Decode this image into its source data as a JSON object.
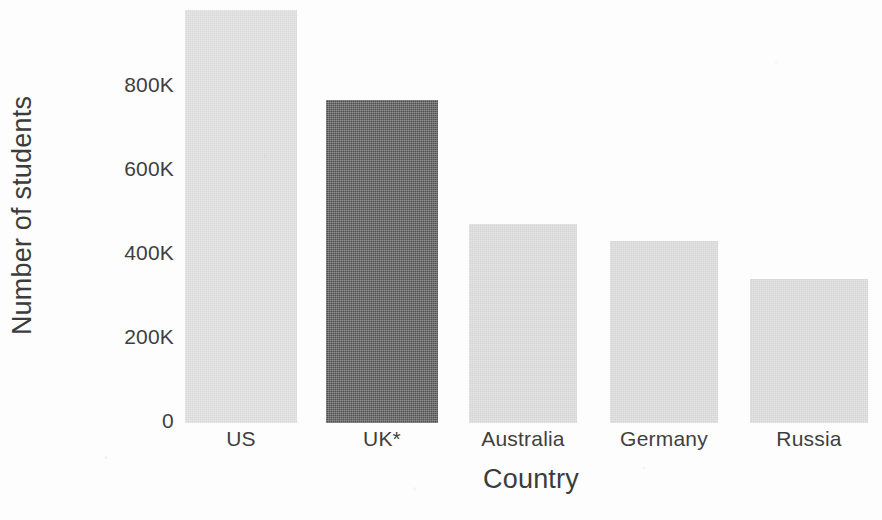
{
  "chart_data": {
    "type": "bar",
    "title": "",
    "xlabel": "Country",
    "ylabel": "Number of students",
    "categories": [
      "US",
      "UK*",
      "Australia",
      "Germany",
      "Russia"
    ],
    "values": [
      983000,
      769000,
      474000,
      433000,
      343000
    ],
    "value_labels": [
      "983K",
      "769K",
      "474K",
      "433K",
      "343K"
    ],
    "ylim": [
      0,
      1000000
    ],
    "yticks": [
      0,
      200000,
      400000,
      600000,
      800000
    ],
    "ytick_labels": [
      "0",
      "200K",
      "400K",
      "600K",
      "800K"
    ],
    "grid": false,
    "legend": null,
    "bar_colors": [
      "#d9d9d9",
      "#4f4f4f",
      "#d5d5d5",
      "#d5d5d5",
      "#d5d5d5"
    ],
    "highlight_category": "UK*",
    "highlight_color": "#4f4f4f",
    "default_bar_color": "#d7d7d7",
    "axis_text_color": "#3f3f3f"
  },
  "axes": {
    "y_title": "Number of students",
    "x_title": "Country"
  },
  "bars": [
    {
      "label": "US",
      "value": 983000,
      "color": "#d9d9d9"
    },
    {
      "label": "UK*",
      "value": 769000,
      "color": "#4f4f4f"
    },
    {
      "label": "Australia",
      "value": 474000,
      "color": "#d5d5d5"
    },
    {
      "label": "Germany",
      "value": 433000,
      "color": "#d5d5d5"
    },
    {
      "label": "Russia",
      "value": 343000,
      "color": "#d5d5d5"
    }
  ],
  "yticks": [
    {
      "label": "800K",
      "value": 800000
    },
    {
      "label": "600K",
      "value": 600000
    },
    {
      "label": "400K",
      "value": 400000
    },
    {
      "label": "200K",
      "value": 200000
    },
    {
      "label": "0",
      "value": 0
    }
  ],
  "geometry": {
    "baseline_y": 421,
    "px_per_unit": 0.00042,
    "plot_left": 180,
    "plot_width": 702,
    "bar_slots": [
      {
        "left": 5,
        "width": 112
      },
      {
        "left": 146,
        "width": 112
      },
      {
        "left": 289,
        "width": 108
      },
      {
        "left": 430,
        "width": 108
      },
      {
        "left": 570,
        "width": 118
      }
    ]
  }
}
